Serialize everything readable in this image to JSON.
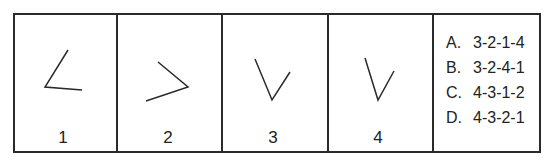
{
  "panels": [
    {
      "label": "1",
      "figure": "angle-opening-up-right",
      "points": [
        [
          68,
          50
        ],
        [
          45,
          87
        ],
        [
          82,
          90
        ]
      ]
    },
    {
      "label": "2",
      "figure": "angle-pointing-right",
      "points": [
        [
          158,
          62
        ],
        [
          188,
          87
        ],
        [
          146,
          101
        ]
      ]
    },
    {
      "label": "3",
      "figure": "v-shape",
      "points": [
        [
          255,
          59
        ],
        [
          272,
          100
        ],
        [
          290,
          72
        ]
      ]
    },
    {
      "label": "4",
      "figure": "v-shape-narrow",
      "points": [
        [
          365,
          58
        ],
        [
          378,
          100
        ],
        [
          394,
          71
        ]
      ]
    }
  ],
  "options": [
    {
      "letter": "A.",
      "value": "3-2-1-4"
    },
    {
      "letter": "B.",
      "value": "3-2-4-1"
    },
    {
      "letter": "C.",
      "value": "4-3-1-2"
    },
    {
      "letter": "D.",
      "value": "4-3-2-1"
    }
  ],
  "colors": {
    "stroke": "#2a2a2a",
    "background": "#ffffff"
  }
}
